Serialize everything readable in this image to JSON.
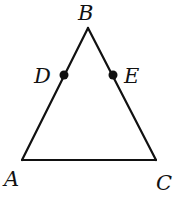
{
  "diagram": {
    "type": "geometry-triangle",
    "stroke_color": "#111111",
    "background": "#ffffff",
    "points": {
      "A": {
        "label": "A",
        "x": 22,
        "y": 160,
        "label_x": 4,
        "label_y": 186
      },
      "B": {
        "label": "B",
        "x": 88,
        "y": 28,
        "label_x": 78,
        "label_y": 20
      },
      "C": {
        "label": "C",
        "x": 156,
        "y": 160,
        "label_x": 156,
        "label_y": 190
      },
      "D": {
        "label": "D",
        "x": 64,
        "y": 75,
        "label_x": 34,
        "label_y": 83
      },
      "E": {
        "label": "E",
        "x": 113,
        "y": 75,
        "label_x": 124,
        "label_y": 83
      }
    },
    "segments": [
      {
        "from": "A",
        "to": "B"
      },
      {
        "from": "B",
        "to": "C"
      },
      {
        "from": "A",
        "to": "C"
      }
    ],
    "marked_points": [
      "D",
      "E"
    ]
  }
}
